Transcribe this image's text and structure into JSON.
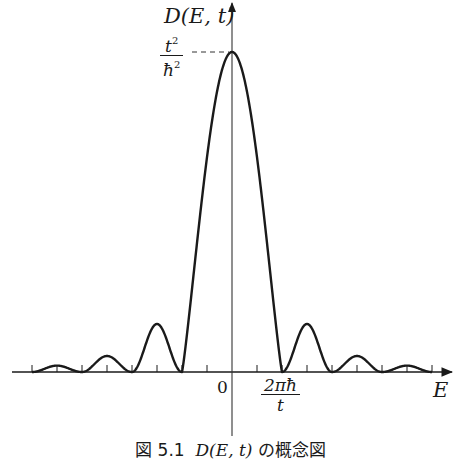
{
  "figure": {
    "y_axis_label": "D(E, t)",
    "x_axis_label": "E",
    "peak_label": {
      "numerator": "t",
      "numerator_exp": "2",
      "denominator": "ħ",
      "denominator_exp": "2"
    },
    "origin_label": "0",
    "zero_label": {
      "numerator": "2πħ",
      "denominator": "t"
    },
    "caption_prefix": "図 5.1",
    "caption_math": "D(E, t)",
    "caption_suffix": "の概念図"
  },
  "colors": {
    "line": "#1a1a1a",
    "axis": "#333333",
    "background": "#ffffff"
  },
  "chart_data": {
    "type": "line",
    "xlabel": "E",
    "ylabel": "D(E, t)",
    "grid": false,
    "legend": "none",
    "x_unit": "2πħ/t",
    "y_unit": "t²/ħ²",
    "xlim": [
      -4.4,
      4.4
    ],
    "ylim": [
      0,
      1.0
    ],
    "x_ticks": [
      -4,
      -3.5,
      -3,
      -2.5,
      -2,
      -1.5,
      -1,
      -0.5,
      0.5,
      1,
      1.5,
      2,
      2.5,
      3,
      3.5,
      4
    ],
    "x_tick_labels": {
      "0": "0",
      "1": "2πħ/t"
    },
    "y_tick_labels": {
      "1": "t²/ħ²"
    },
    "zeros": [
      -4,
      -3,
      -2,
      -1,
      1,
      2,
      3,
      4
    ],
    "peaks": [
      {
        "x": -3.5,
        "y": 0.02
      },
      {
        "x": -2.5,
        "y": 0.05
      },
      {
        "x": -1.5,
        "y": 0.15
      },
      {
        "x": 0,
        "y": 1.0
      },
      {
        "x": 1.5,
        "y": 0.15
      },
      {
        "x": 2.5,
        "y": 0.05
      },
      {
        "x": 3.5,
        "y": 0.02
      }
    ]
  }
}
